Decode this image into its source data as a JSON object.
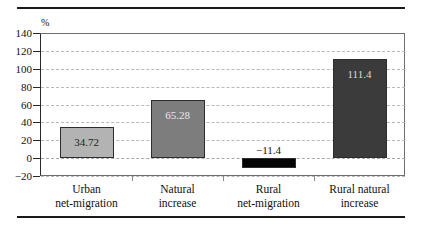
{
  "chart_data": {
    "type": "bar",
    "title": "",
    "subtitle": "",
    "xlabel": "",
    "ylabel": "%",
    "unit": "%",
    "categories": [
      "Urban net-migration",
      "Natural increase",
      "Rural net-migration",
      "Rural natural increase"
    ],
    "category_lines": [
      [
        "Urban",
        "net-migration"
      ],
      [
        "Natural",
        "increase"
      ],
      [
        "Rural",
        "net-migration"
      ],
      [
        "Rural natural",
        "increase"
      ]
    ],
    "values": [
      34.72,
      65.28,
      -11.4,
      111.4
    ],
    "value_labels": [
      "34.72",
      "65.28",
      "−11.4",
      "111.4"
    ],
    "bar_colors": [
      "#b3b3b3",
      "#7d7d7d",
      "#050505",
      "#3b3b3b"
    ],
    "ylim": [
      -20,
      140
    ],
    "ytick_labels": [
      "140",
      "120",
      "100",
      "80",
      "60",
      "40",
      "20",
      "0",
      "−20"
    ],
    "ytick_values": [
      140,
      120,
      100,
      80,
      60,
      40,
      20,
      0,
      -20
    ],
    "grid": true,
    "grid_style": "dashed",
    "legend": "none"
  },
  "style": {
    "axis_color": "#2a2a2a",
    "grid_color": "#b9b9b9",
    "frame_color": "#6e6e6e",
    "rule_color": "#1a1a1a",
    "background": "#ffffff"
  }
}
